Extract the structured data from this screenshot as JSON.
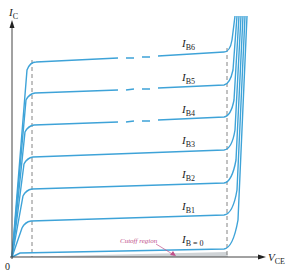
{
  "diagram": {
    "axes": {
      "y_label": "I",
      "y_sub": "C",
      "x_label": "V",
      "x_sub": "CE",
      "origin": "0"
    },
    "curves": [
      {
        "label": "I",
        "sub": "B6",
        "y": 62
      },
      {
        "label": "I",
        "sub": "B5",
        "y": 94
      },
      {
        "label": "I",
        "sub": "B4",
        "y": 126
      },
      {
        "label": "I",
        "sub": "B3",
        "y": 158
      },
      {
        "label": "I",
        "sub": "B2",
        "y": 190
      },
      {
        "label": "I",
        "sub": "B1",
        "y": 222
      },
      {
        "label": "I",
        "sub": "B = 0",
        "y": 252
      }
    ],
    "annotations": {
      "cutoff": "Cutoff region"
    },
    "colors": {
      "curve": "#3ea3d8",
      "axis": "#444444",
      "dashed": "#777777",
      "cutoff_fill": "#cfd3d6",
      "cutoff_text": "#c0508a"
    }
  }
}
